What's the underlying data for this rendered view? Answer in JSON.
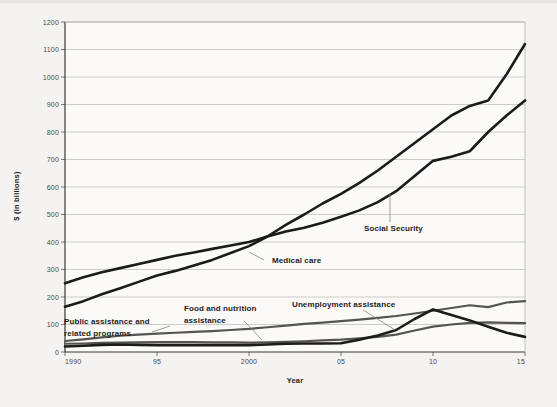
{
  "chart_data": {
    "type": "line",
    "title": "",
    "xlabel": "Year",
    "ylabel": "$ (in billions)",
    "xlim": [
      1990,
      2015
    ],
    "ylim": [
      0,
      1200
    ],
    "grid": true,
    "legend_position": "inline-annotations",
    "x": [
      1990,
      1991,
      1992,
      1993,
      1994,
      1995,
      1996,
      1997,
      1998,
      1999,
      2000,
      2001,
      2002,
      2003,
      2004,
      2005,
      2006,
      2007,
      2008,
      2009,
      2010,
      2011,
      2012,
      2013,
      2014,
      2015
    ],
    "xticks": [
      1990,
      1995,
      2000,
      2005,
      2010,
      2015
    ],
    "xtick_labels": [
      "1990",
      "95",
      "2000",
      "05",
      "10",
      "15"
    ],
    "yticks": [
      0,
      100,
      200,
      300,
      400,
      500,
      600,
      700,
      800,
      900,
      1000,
      1100,
      1200
    ],
    "ytick_labels": [
      "0",
      "100",
      "200",
      "300",
      "400",
      "500",
      "600",
      "700",
      "800",
      "900",
      "1000",
      "1100",
      "1200"
    ],
    "series": [
      {
        "name": "Medical care",
        "color": "#1d1b19",
        "width": 2.6,
        "label_text": "Medical care",
        "values": [
          165,
          185,
          210,
          232,
          255,
          278,
          295,
          315,
          335,
          360,
          385,
          420,
          462,
          500,
          540,
          575,
          615,
          660,
          710,
          760,
          810,
          860,
          895,
          915,
          1010,
          1120
        ]
      },
      {
        "name": "Social Security",
        "color": "#1d1b19",
        "width": 2.6,
        "label_text": "Social Security",
        "values": [
          250,
          272,
          290,
          305,
          320,
          335,
          350,
          362,
          375,
          387,
          400,
          420,
          438,
          452,
          470,
          492,
          515,
          545,
          585,
          640,
          695,
          710,
          730,
          800,
          860,
          915
        ]
      },
      {
        "name": "Public assistance and related programs",
        "color": "#57544f",
        "width": 2.2,
        "label_text": "Public assistance and related programs",
        "values": [
          40,
          46,
          53,
          59,
          63,
          67,
          70,
          73,
          76,
          80,
          84,
          90,
          96,
          102,
          107,
          112,
          118,
          124,
          131,
          140,
          150,
          160,
          170,
          163,
          180,
          185
        ]
      },
      {
        "name": "Food and nutrition assistance",
        "color": "#57544f",
        "width": 2.2,
        "label_text": "Food and nutrition assistance",
        "values": [
          30,
          31,
          33,
          34,
          35,
          36,
          36,
          36,
          35,
          35,
          34,
          35,
          37,
          39,
          42,
          45,
          50,
          55,
          63,
          78,
          92,
          100,
          106,
          108,
          106,
          105
        ]
      },
      {
        "name": "Unemployment assistance",
        "color": "#1d1b19",
        "width": 2.6,
        "label_text": "Unemployment assistance",
        "values": [
          20,
          23,
          26,
          27,
          26,
          25,
          25,
          25,
          25,
          25,
          25,
          27,
          30,
          31,
          31,
          32,
          45,
          60,
          80,
          120,
          155,
          135,
          115,
          92,
          70,
          55
        ]
      }
    ],
    "annotations": [
      {
        "name": "medical-care",
        "text": "Medical care",
        "x_px": 272,
        "y_px": 263,
        "leader": {
          "x1": 264,
          "y1": 260,
          "x2": 249,
          "y2": 252
        }
      },
      {
        "name": "social-security",
        "text": "Social Security",
        "x_px": 364,
        "y_px": 231,
        "leader": {
          "x1": 390,
          "y1": 222,
          "x2": 390,
          "y2": 194
        }
      },
      {
        "name": "unemployment-assistance",
        "text": "Unemployment assistance",
        "x_px": 292,
        "y_px": 307,
        "leader": {
          "x1": 363,
          "y1": 310,
          "x2": 395,
          "y2": 330
        }
      },
      {
        "name": "food-and-nutrition-assistance",
        "text": "Food and nutrition assistance",
        "x_px": 184,
        "y_px": 311,
        "leader": {
          "x1": 244,
          "y1": 321,
          "x2": 262,
          "y2": 340
        }
      },
      {
        "name": "public-assistance-and-related-programs",
        "text": "Public assistance and related programs",
        "x_px": 64,
        "y_px": 324,
        "leader": {
          "x1": 152,
          "y1": 332,
          "x2": 170,
          "y2": 326
        }
      }
    ]
  },
  "axes": {
    "y_title": "$ (in billions)",
    "x_title": "Year"
  }
}
